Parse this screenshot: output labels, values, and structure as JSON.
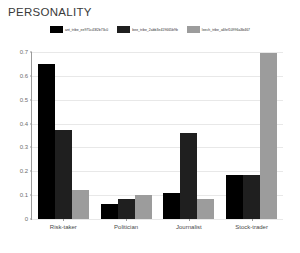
{
  "chart_data": {
    "type": "bar",
    "title": "PERSONALITY",
    "xlabel": "",
    "ylabel": "",
    "ylim": [
      0,
      0.7
    ],
    "yticks": [
      "0",
      "0.1",
      "0.2",
      "0.3",
      "0.4",
      "0.5",
      "0.6",
      "0.7"
    ],
    "grid": true,
    "legend_position": "top-center",
    "categories": [
      "Risk-taker",
      "Politician",
      "Journalist",
      "Stock-trader"
    ],
    "series": [
      {
        "name": "ant_tribe_ee975c43f2b73c0",
        "color": "#000000",
        "values": [
          0.65,
          0.065,
          0.11,
          0.185
        ]
      },
      {
        "name": "bee_tribe_2abb3e419665b9b",
        "color": "#1f1f1f",
        "values": [
          0.375,
          0.085,
          0.36,
          0.185
        ]
      },
      {
        "name": "leech_tribe_a6fef10996a3b467",
        "color": "#9c9c9c",
        "values": [
          0.12,
          0.1,
          0.085,
          0.695
        ]
      }
    ]
  }
}
